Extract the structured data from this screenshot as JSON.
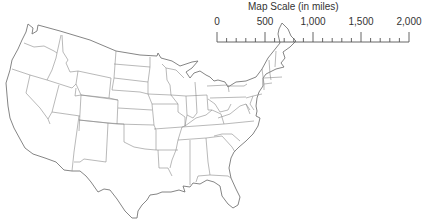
{
  "map": {
    "title": "Outline map of the contiguous United States",
    "region": "Contiguous United States",
    "style": "state outlines, no labels",
    "colors": {
      "border": "#8a8a8a",
      "outline": "#777777",
      "background": "#ffffff"
    }
  },
  "scale": {
    "title": "Map Scale (in miles)",
    "units": "miles",
    "labels": [
      "0",
      "500",
      "1,000",
      "1,500",
      "2,000"
    ],
    "major_interval": 500,
    "minor_interval": 100
  }
}
